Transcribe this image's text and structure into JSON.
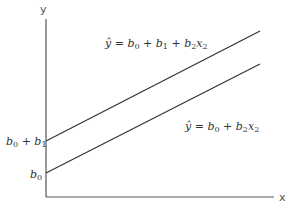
{
  "diagram": {
    "axes": {
      "y_label": "y",
      "x_label": "x",
      "color": "#555555"
    },
    "lines": [
      {
        "name": "upper",
        "equation": {
          "yhat": "ŷ",
          "eq": " = ",
          "b0": "b",
          "b0_sub": "0",
          "plus1": " + ",
          "b1": "b",
          "b1_sub": "1",
          "plus2": " + ",
          "b2": "b",
          "b2_sub": "2",
          "x2": "x",
          "x2_sub": "2"
        },
        "intercept_label": {
          "b0": "b",
          "b0_sub": "0",
          "plus": " + ",
          "b1": "b",
          "b1_sub": "1"
        },
        "color": "#333333"
      },
      {
        "name": "lower",
        "equation": {
          "yhat": "ŷ",
          "eq": " = ",
          "b0": "b",
          "b0_sub": "0",
          "plus": " + ",
          "b2": "b",
          "b2_sub": "2",
          "x2": "x",
          "x2_sub": "2"
        },
        "intercept_label": {
          "b0": "b",
          "b0_sub": "0"
        },
        "color": "#333333"
      }
    ]
  }
}
